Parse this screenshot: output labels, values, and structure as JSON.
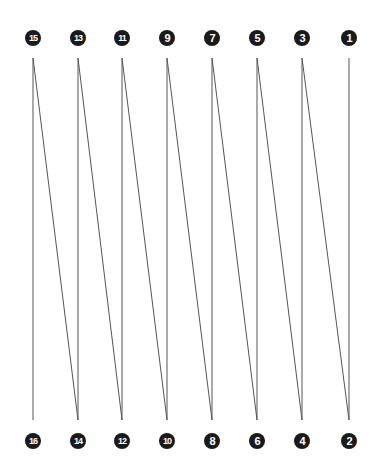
{
  "diagram": {
    "type": "numbered-zigzag-path",
    "line_color": "#555555",
    "marker_color": "#1a1a1a",
    "marker_text_color": "#ffffff",
    "top_y": 38,
    "bottom_y": 441,
    "line_top_y": 58,
    "line_bottom_y": 420,
    "points": [
      {
        "label": "1",
        "x": 349,
        "row": "top"
      },
      {
        "label": "2",
        "x": 349,
        "row": "bottom"
      },
      {
        "label": "3",
        "x": 302,
        "row": "top"
      },
      {
        "label": "4",
        "x": 302,
        "row": "bottom"
      },
      {
        "label": "5",
        "x": 257,
        "row": "top"
      },
      {
        "label": "6",
        "x": 257,
        "row": "bottom"
      },
      {
        "label": "7",
        "x": 212,
        "row": "top"
      },
      {
        "label": "8",
        "x": 212,
        "row": "bottom"
      },
      {
        "label": "9",
        "x": 167,
        "row": "top"
      },
      {
        "label": "10",
        "x": 167,
        "row": "bottom"
      },
      {
        "label": "11",
        "x": 122,
        "row": "top"
      },
      {
        "label": "12",
        "x": 122,
        "row": "bottom"
      },
      {
        "label": "13",
        "x": 78,
        "row": "top"
      },
      {
        "label": "14",
        "x": 78,
        "row": "bottom"
      },
      {
        "label": "15",
        "x": 33,
        "row": "top"
      },
      {
        "label": "16",
        "x": 33,
        "row": "bottom"
      }
    ]
  }
}
